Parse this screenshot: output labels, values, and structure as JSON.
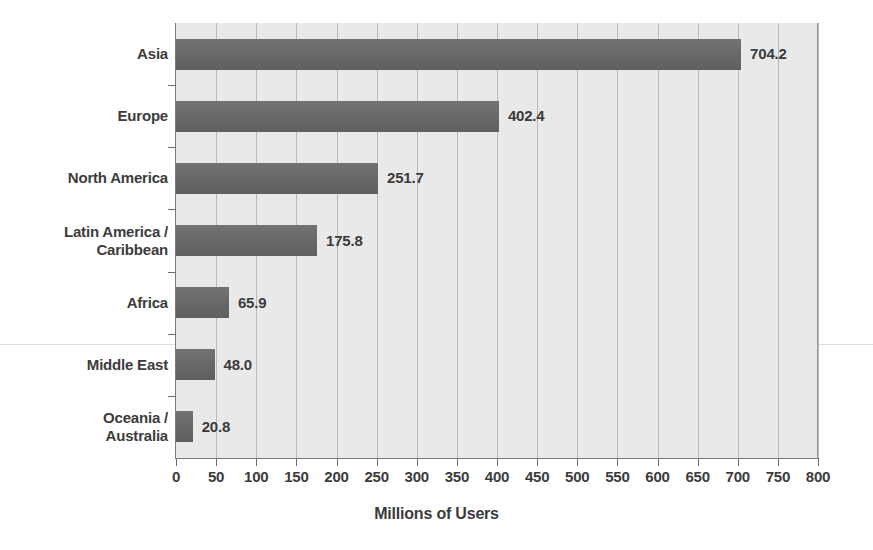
{
  "chart_data": {
    "type": "bar",
    "orientation": "horizontal",
    "title": "",
    "xlabel": "Millions of Users",
    "ylabel": "",
    "xlim": [
      0,
      800
    ],
    "xticks": [
      0,
      50,
      100,
      150,
      200,
      250,
      300,
      350,
      400,
      450,
      500,
      550,
      600,
      650,
      700,
      750,
      800
    ],
    "xtick_labels": [
      "0",
      "50",
      "100",
      "150",
      "200",
      "250",
      "300",
      "350",
      "400",
      "450",
      "500",
      "550",
      "600",
      "650",
      "700",
      "750",
      "800"
    ],
    "grid": "vertical",
    "legend": "none",
    "categories": [
      "Asia",
      "Europe",
      "North America",
      "Latin America /\nCaribbean",
      "Africa",
      "Middle East",
      "Oceania /\nAustralia"
    ],
    "values": [
      704.2,
      402.4,
      251.7,
      175.8,
      65.9,
      48.0,
      20.8
    ],
    "value_labels": [
      "704.2",
      "402.4",
      "251.7",
      "175.8",
      "65.9",
      "48.0",
      "20.8"
    ],
    "bar_color": "#6b6b6b",
    "plot_background": "#e9e9e9",
    "figure_background": "#ffffff",
    "text_color": "#3b3b3b",
    "gridline_color": "#b9b9b9"
  }
}
